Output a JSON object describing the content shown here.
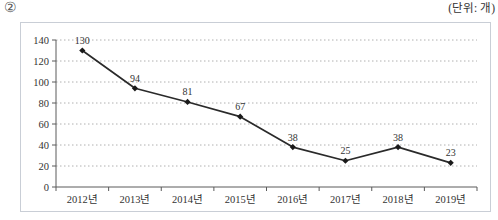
{
  "page": {
    "index_label": "②",
    "unit_label": "(단위: 개)"
  },
  "chart_data": {
    "type": "line",
    "title": "",
    "xlabel": "",
    "ylabel": "",
    "categories": [
      "2012년",
      "2013년",
      "2014년",
      "2015년",
      "2016년",
      "2017년",
      "2018년",
      "2019년"
    ],
    "values": [
      130,
      94,
      81,
      67,
      38,
      25,
      38,
      23
    ],
    "data_labels": [
      "130",
      "94",
      "81",
      "67",
      "38",
      "25",
      "38",
      "23"
    ],
    "ylim": [
      0,
      140
    ],
    "yticks": [
      0,
      20,
      40,
      60,
      80,
      100,
      120,
      140
    ],
    "ytick_labels": [
      "0",
      "20",
      "40",
      "60",
      "80",
      "100",
      "120",
      "140"
    ],
    "grid": "horizontal-dotted",
    "legend_position": "none",
    "marker": "diamond",
    "colors": {
      "line": "#2a2a2a",
      "marker": "#1a1a1a",
      "gridline": "#b0b0b0",
      "axis": "#5a5a5a",
      "tick_text": "#333333",
      "data_label_text": "#333333",
      "panel_border": "#c9ced6"
    }
  }
}
